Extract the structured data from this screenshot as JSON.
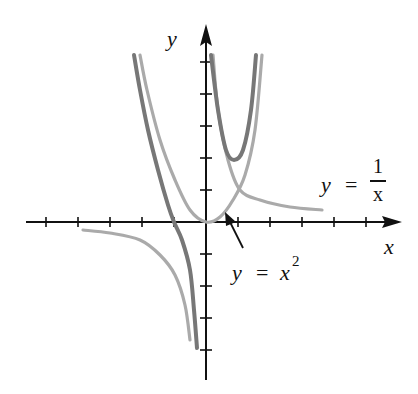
{
  "chart_data": {
    "type": "line",
    "title": "",
    "xlabel": "x",
    "ylabel": "y",
    "grid": false,
    "legend": null,
    "axes": {
      "origin_px": [
        206,
        222
      ],
      "unit_px": 32,
      "x_ticks": [
        -5,
        -4,
        -3,
        -2,
        -1,
        1,
        2,
        3,
        4,
        5
      ],
      "y_ticks": [
        -4,
        -3,
        -2,
        -1,
        1,
        2,
        3,
        4,
        5
      ],
      "xlim": [
        -5.8,
        6.1
      ],
      "ylim": [
        -5,
        6
      ]
    },
    "series": [
      {
        "name": "y = x^2",
        "color": "#aaaaaa",
        "points_px": [
          [
            140,
            55
          ],
          [
            147,
            90
          ],
          [
            160,
            140
          ],
          [
            175,
            180
          ],
          [
            190,
            210
          ],
          [
            206,
            222
          ],
          [
            220,
            217
          ],
          [
            233,
            200
          ],
          [
            245,
            175
          ],
          [
            255,
            130
          ],
          [
            262,
            55
          ]
        ]
      },
      {
        "name": "y = 1/x (right branch)",
        "color": "#aaaaaa",
        "points_px": [
          [
            213,
            55
          ],
          [
            218,
            110
          ],
          [
            228,
            160
          ],
          [
            240,
            190
          ],
          [
            260,
            200
          ],
          [
            290,
            207
          ],
          [
            322,
            210
          ]
        ]
      },
      {
        "name": "y = 1/x (left branch)",
        "color": "#aaaaaa",
        "points_px": [
          [
            83,
            230
          ],
          [
            110,
            233
          ],
          [
            140,
            240
          ],
          [
            160,
            255
          ],
          [
            175,
            275
          ],
          [
            185,
            305
          ],
          [
            190,
            340
          ]
        ]
      },
      {
        "name": "y = x^2 + 1/x (right branch)",
        "color": "#777777",
        "points_px": [
          [
            211,
            55
          ],
          [
            218,
            110
          ],
          [
            226,
            150
          ],
          [
            234,
            160
          ],
          [
            243,
            150
          ],
          [
            251,
            110
          ],
          [
            256,
            55
          ]
        ]
      },
      {
        "name": "y = x^2 + 1/x (left branch)",
        "color": "#777777",
        "points_px": [
          [
            134,
            55
          ],
          [
            140,
            90
          ],
          [
            148,
            130
          ],
          [
            158,
            170
          ],
          [
            168,
            205
          ],
          [
            174,
            222
          ],
          [
            182,
            240
          ],
          [
            190,
            270
          ],
          [
            194,
            310
          ],
          [
            197,
            348
          ]
        ]
      }
    ],
    "annotations": [
      {
        "text": "y = 1/x",
        "lhs": "y",
        "eq": "=",
        "num": "1",
        "den": "x"
      },
      {
        "text": "y = x²",
        "lhs": "y",
        "eq": "=",
        "base": "x",
        "exp": "2",
        "arrow_from_px": [
          243,
          248
        ],
        "arrow_to_px": [
          226,
          214
        ]
      }
    ]
  },
  "labels": {
    "x_axis": "x",
    "y_axis": "y",
    "recip": {
      "lhs": "y",
      "eq": "=",
      "num": "1",
      "den": "x"
    },
    "square": {
      "lhs": "y",
      "eq": "=",
      "base": "x",
      "exp": "2"
    }
  }
}
